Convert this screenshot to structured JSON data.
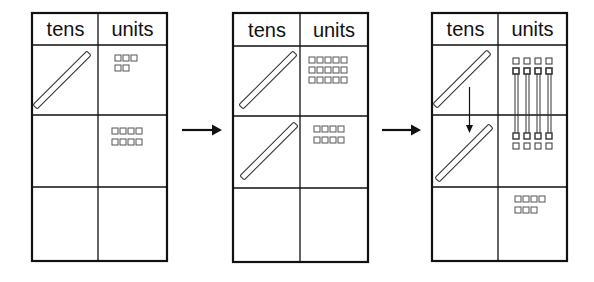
{
  "diagram": {
    "type": "place-value regrouping (tens and units)",
    "panels": [
      {
        "id": "panel-1",
        "headers": {
          "tens": "tens",
          "units": "units"
        },
        "rows": [
          {
            "tens_rods": 1,
            "units_squares": 5
          },
          {
            "tens_rods": 0,
            "units_squares": 8
          },
          {
            "tens_rods": 0,
            "units_squares": 0
          }
        ]
      },
      {
        "id": "panel-2",
        "headers": {
          "tens": "tens",
          "units": "units"
        },
        "rows": [
          {
            "tens_rods": 1,
            "units_squares": 15
          },
          {
            "tens_rods": 1,
            "units_squares": 8
          },
          {
            "tens_rods": 0,
            "units_squares": 0
          }
        ]
      },
      {
        "id": "panel-3",
        "headers": {
          "tens": "tens",
          "units": "units"
        },
        "rows": [
          {
            "tens_rods": 1,
            "units_squares": 8,
            "note": "units linked to row 2 (regrouped into a ten)"
          },
          {
            "tens_rods": 1,
            "units_squares": 8,
            "note": "units linked to row 1"
          },
          {
            "tens_rods": 0,
            "units_squares": 7
          }
        ],
        "tens_move_arrow": "down from row 1 to row 2"
      }
    ],
    "arrows": [
      {
        "from": "panel-1",
        "to": "panel-2",
        "direction": "right"
      },
      {
        "from": "panel-2",
        "to": "panel-3",
        "direction": "right"
      }
    ],
    "colors": {
      "line": "#111111",
      "square": "#555555",
      "background": "#ffffff"
    }
  }
}
